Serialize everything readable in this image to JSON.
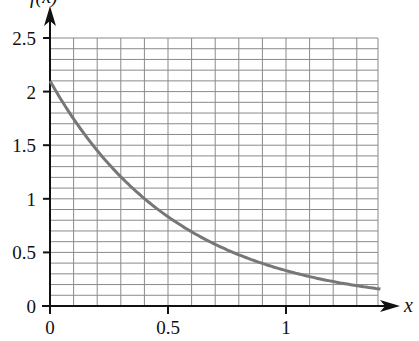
{
  "chart_data": {
    "type": "line",
    "title": "",
    "xlabel": "x",
    "ylabel": "f(x)",
    "xlim": [
      0,
      1.4
    ],
    "ylim": [
      0,
      2.5
    ],
    "grid": true,
    "grid_minor_step_x": 0.1,
    "grid_minor_step_y": 0.1,
    "x_ticks": [
      0,
      0.5,
      1
    ],
    "x_tick_labels": [
      "0",
      "0.5",
      "1"
    ],
    "y_ticks": [
      0,
      0.5,
      1,
      1.5,
      2,
      2.5
    ],
    "y_tick_labels": [
      "0",
      "0.5",
      "1",
      "1.5",
      "2",
      "2.5"
    ],
    "legend": null,
    "series": [
      {
        "name": "f(x)",
        "color": "#777777",
        "x": [
          0,
          0.1,
          0.2,
          0.3,
          0.4,
          0.5,
          0.6,
          0.7,
          0.8,
          0.9,
          1.0,
          1.1,
          1.2,
          1.3,
          1.4
        ],
        "y": [
          2.1,
          1.75,
          1.45,
          1.2,
          1.0,
          0.83,
          0.69,
          0.57,
          0.48,
          0.4,
          0.33,
          0.27,
          0.23,
          0.19,
          0.16
        ]
      }
    ]
  },
  "colors": {
    "axis": "#111111",
    "grid": "#8a8a8a",
    "curve": "#777777"
  }
}
